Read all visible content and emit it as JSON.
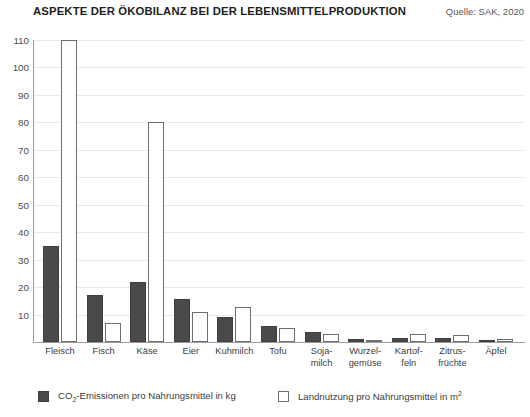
{
  "header": {
    "title": "ASPEKTE DER ÖKOBILANZ BEI DER LEBENSMITTELPRODUKTION",
    "source": "Quelle: SAK, 2020"
  },
  "legend": {
    "items": [
      {
        "key": "co2",
        "label": "CO2-Emissionen pro Nahrungsmittel in kg",
        "label_main": "CO",
        "label_sub": "2",
        "label_rest": "-Emissionen pro Nahrungsmittel in kg",
        "color": "#4a4a4a"
      },
      {
        "key": "land",
        "label": "Landnutzung pro Nahrungsmittel in m2",
        "label_main": "Landnutzung pro Nahrungsmittel in m",
        "label_sub": "2",
        "label_rest": "",
        "color": "#ffffff"
      }
    ]
  },
  "chart_data": {
    "type": "bar",
    "title": "ASPEKTE DER ÖKOBILANZ BEI DER LEBENSMITTELPRODUKTION",
    "subtitle": "Quelle: SAK, 2020",
    "xlabel": "",
    "ylabel": "",
    "ylim": [
      0,
      110
    ],
    "yticks": [
      10,
      20,
      30,
      40,
      50,
      60,
      70,
      80,
      90,
      100,
      110
    ],
    "grid": true,
    "legend_position": "bottom",
    "categories": [
      "Fleisch",
      "Fisch",
      "Käse",
      "Eier",
      "Kuhmilch",
      "Tofu",
      "Soja-\nmilch",
      "Wurzel-\ngemüse",
      "Kartof-\nfeln",
      "Zitrus-\nfrüchte",
      "Äpfel"
    ],
    "category_lines": [
      [
        "Fleisch"
      ],
      [
        "Fisch"
      ],
      [
        "Käse"
      ],
      [
        "Eier"
      ],
      [
        "Kuhmilch"
      ],
      [
        "Tofu"
      ],
      [
        "Soja-",
        "milch"
      ],
      [
        "Wurzel-",
        "gemüse"
      ],
      [
        "Kartof-",
        "feln"
      ],
      [
        "Zitrus-",
        "früchte"
      ],
      [
        "Äpfel"
      ]
    ],
    "series": [
      {
        "name": "CO2-Emissionen pro Nahrungsmittel in kg",
        "key": "co2",
        "color": "#4a4a4a",
        "values": [
          35,
          17,
          22,
          15.5,
          9,
          6,
          3.5,
          1,
          1.5,
          1.5,
          0.8
        ]
      },
      {
        "name": "Landnutzung pro Nahrungsmittel in m2",
        "key": "land",
        "color": "#ffffff",
        "values": [
          110,
          7,
          80,
          11,
          12.7,
          5,
          3,
          0.8,
          3,
          2.5,
          1.2
        ]
      }
    ]
  }
}
